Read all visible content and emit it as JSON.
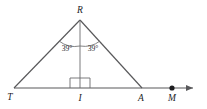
{
  "figure": {
    "type": "geometry-diagram",
    "background_color": "#ffffff",
    "line_color": "#58585a",
    "label_color": "#1d1d1f"
  },
  "vertices": [
    {
      "key": "apex",
      "label": "R",
      "x": 80,
      "y": 20,
      "label_x": 80,
      "label_y": 13
    },
    {
      "key": "base_left",
      "label": "T",
      "x": 14,
      "y": 88,
      "label_x": 10,
      "label_y": 100
    },
    {
      "key": "foot",
      "label": "I",
      "x": 80,
      "y": 88,
      "label_x": 80,
      "label_y": 101
    },
    {
      "key": "base_right",
      "label": "A",
      "x": 142,
      "y": 88,
      "label_x": 141,
      "label_y": 101
    },
    {
      "key": "ray_point",
      "label": "M",
      "x": 172,
      "y": 88,
      "label_x": 172,
      "label_y": 101
    }
  ],
  "segments": [
    {
      "name": "side-RT",
      "from": "R",
      "to": "T"
    },
    {
      "name": "side-RA",
      "from": "R",
      "to": "A"
    },
    {
      "name": "altitude-RI",
      "from": "R",
      "to": "I"
    },
    {
      "name": "baseline-TM",
      "from": "T",
      "to": "ray-end"
    }
  ],
  "angles": [
    {
      "name": "angle-TRI",
      "label": "39°",
      "value": 39,
      "unit": "degrees",
      "at": "R",
      "side": "left",
      "label_x": 67,
      "label_y": 51
    },
    {
      "name": "angle-IRA",
      "label": "39°",
      "value": 39,
      "unit": "degrees",
      "at": "R",
      "side": "right",
      "label_x": 93,
      "label_y": 51
    }
  ],
  "marks": [
    {
      "name": "right-angle-mark",
      "at": "I",
      "type": "square",
      "size": 10
    },
    {
      "name": "point-marker-M",
      "at": "M",
      "type": "filled-dot",
      "radius": 2.6
    },
    {
      "name": "ray-arrow",
      "at": "east",
      "type": "arrowhead",
      "direction": "right"
    }
  ]
}
